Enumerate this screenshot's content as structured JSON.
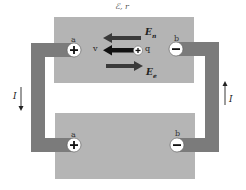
{
  "diagram": {
    "emf_label": "ℰ, r",
    "source": {
      "terminal_a": {
        "label": "a",
        "sign": "+"
      },
      "terminal_b": {
        "label": "b",
        "sign": "−"
      },
      "vectors": {
        "En": {
          "main": "E",
          "sub": "n",
          "direction": "left"
        },
        "v": {
          "label": "v",
          "direction": "left"
        },
        "charge": {
          "label": "q",
          "sign": "+"
        },
        "Ee": {
          "main": "E",
          "sub": "e",
          "direction": "right"
        }
      }
    },
    "load": {
      "terminal_a": {
        "label": "a",
        "sign": "+"
      },
      "terminal_b": {
        "label": "b",
        "sign": "−"
      }
    },
    "current_left": {
      "label": "I",
      "direction": "down"
    },
    "current_right": {
      "label": "I",
      "direction": "up"
    },
    "colors": {
      "box": "#b4b4b4",
      "wire": "#7b7b7b",
      "arrow": "#3a3a3a",
      "arrow_v": "#111111"
    }
  }
}
